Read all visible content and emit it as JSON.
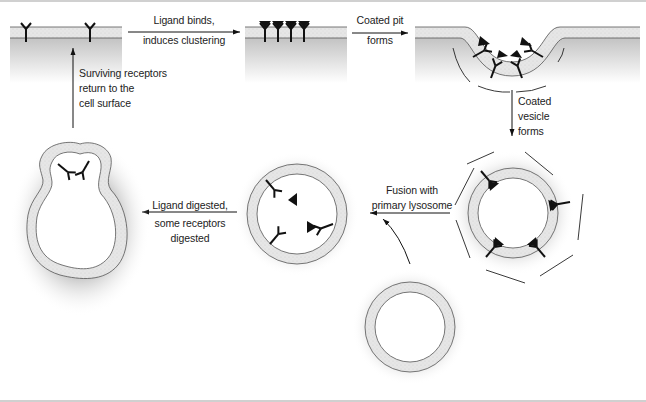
{
  "diagram": {
    "steps": [
      {
        "id": "surface",
        "name": "Cell surface with dispersed receptors"
      },
      {
        "id": "cluster",
        "name": "Receptors clustered with bound ligand"
      },
      {
        "id": "pit",
        "name": "Coated pit"
      },
      {
        "id": "vesicle",
        "name": "Coated vesicle"
      },
      {
        "id": "endosome",
        "name": "Fused vesicle with lysosome"
      },
      {
        "id": "recycling",
        "name": "Recycling vesicle"
      },
      {
        "id": "lysosome",
        "name": "Primary lysosome"
      }
    ],
    "arrows": {
      "a1": {
        "line1": "Ligand binds,",
        "line2": "induces clustering"
      },
      "a2": {
        "line1": "Coated pit",
        "line2": "forms"
      },
      "a3": {
        "line1": "Coated",
        "line2": "vesicle",
        "line3": "forms"
      },
      "a4": {
        "line1": "Fusion with",
        "line2": "primary lysosome"
      },
      "a5": {
        "line1": "Ligand digested,",
        "line2": "some receptors",
        "line3": "digested"
      },
      "a6": {
        "line1": "Surviving receptors",
        "line2": "return to the",
        "line3": "cell surface"
      }
    },
    "colors": {
      "membrane_fill": "#e4e4e4",
      "cytoplasm_shade": "#b8b8b8",
      "stroke": "#111111",
      "outline": "#555555",
      "rule": "#d0d0d0"
    }
  }
}
